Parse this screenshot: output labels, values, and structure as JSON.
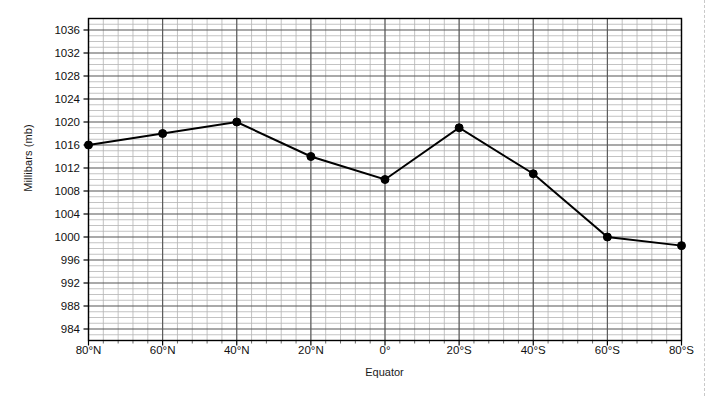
{
  "chart_data": {
    "type": "line",
    "title": "",
    "xlabel": "Equator",
    "ylabel": "Millibars (mb)",
    "categories": [
      "80°N",
      "60°N",
      "40°N",
      "20°N",
      "0°",
      "20°S",
      "40°S",
      "60°S",
      "80°S"
    ],
    "values": [
      1016,
      1018,
      1020,
      1014,
      1010,
      1019,
      1011,
      1000,
      998.5
    ],
    "x_tick_labels": [
      "80°N",
      "60°N",
      "40°N",
      "20°N",
      "0°",
      "20°S",
      "40°S",
      "60°S",
      "80°S"
    ],
    "y_tick_labels": [
      "1036",
      "1032",
      "1028",
      "1024",
      "1020",
      "1016",
      "1012",
      "1008",
      "1004",
      "1000",
      "996",
      "992",
      "988",
      "984"
    ],
    "y_tick_values": [
      1036,
      1032,
      1028,
      1024,
      1020,
      1016,
      1012,
      1008,
      1004,
      1000,
      996,
      992,
      988,
      984
    ],
    "ylim": [
      982,
      1038
    ],
    "xlim": [
      0,
      8
    ],
    "y_major_step": 4,
    "y_minor_step": 1,
    "x_minor_per_major": 5,
    "grid": true,
    "legend": "none",
    "series_color": "#000000",
    "grid_major_color": "#555555",
    "grid_minor_color": "#b4b4b4",
    "marker": "circle",
    "marker_size": 4,
    "line_width": 2
  }
}
